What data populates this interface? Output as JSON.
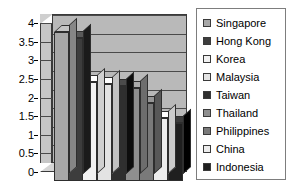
{
  "chart_data": {
    "type": "bar",
    "title": "",
    "subtitle": "",
    "xlabel": "",
    "ylabel": "",
    "ylim": [
      0,
      4
    ],
    "ytick_labels": [
      "4",
      "3.5",
      "3",
      "2.5",
      "2",
      "1.5",
      "1",
      "0.5",
      "0"
    ],
    "ytick_values": [
      4,
      3.5,
      3,
      2.5,
      2,
      1.5,
      1,
      0.5,
      0
    ],
    "grid": true,
    "legend_position": "right",
    "style": "3d-column",
    "categories": [
      "Singapore",
      "Hong Kong",
      "Korea",
      "Malaysia",
      "Taiwan",
      "Thailand",
      "Philippines",
      "China",
      "Indonesia"
    ],
    "values": [
      4.0,
      3.85,
      2.65,
      2.6,
      2.55,
      2.5,
      2.1,
      1.7,
      1.55
    ],
    "series": [
      {
        "name": "",
        "values": [
          4.0,
          3.85,
          2.65,
          2.6,
          2.55,
          2.5,
          2.1,
          1.7,
          1.55
        ]
      }
    ],
    "colors": [
      "#a8a8a8",
      "#3d3d3d",
      "#f2f2f2",
      "#e3e3e3",
      "#2f2f2f",
      "#8f8f8f",
      "#7a7a7a",
      "#ededed",
      "#1f1f1f"
    ],
    "annotations": []
  },
  "legend": {
    "items": [
      {
        "label": "Singapore",
        "color": "#a8a8a8"
      },
      {
        "label": "Hong Kong",
        "color": "#3d3d3d"
      },
      {
        "label": "Korea",
        "color": "#f2f2f2"
      },
      {
        "label": "Malaysia",
        "color": "#e3e3e3"
      },
      {
        "label": "Taiwan",
        "color": "#2f2f2f"
      },
      {
        "label": "Thailand",
        "color": "#8f8f8f"
      },
      {
        "label": "Philippines",
        "color": "#7a7a7a"
      },
      {
        "label": "China",
        "color": "#ededed"
      },
      {
        "label": "Indonesia",
        "color": "#1f1f1f"
      }
    ]
  },
  "axis": {
    "y_labels": [
      "4",
      "3.5",
      "3",
      "2.5",
      "2",
      "1.5",
      "1",
      "0.5",
      "0"
    ]
  }
}
